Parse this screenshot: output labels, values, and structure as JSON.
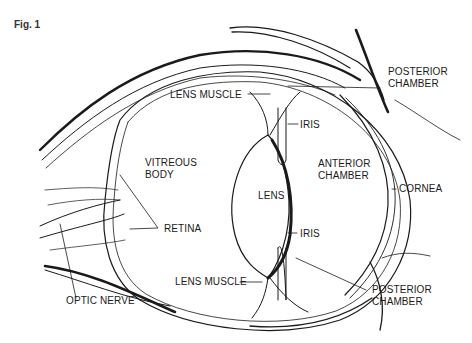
{
  "figure": {
    "caption": "Fig. 1"
  },
  "labels": {
    "posterior_chamber_top": "POSTERIOR\nCHAMBER",
    "lens_muscle_top": "LENS MUSCLE",
    "iris_top": "IRIS",
    "vitreous_body": "VITREOUS\nBODY",
    "lens": "LENS",
    "anterior_chamber": "ANTERIOR\nCHAMBER",
    "cornea": "CORNEA",
    "retina": "RETINA",
    "iris_bottom": "IRIS",
    "lens_muscle_bottom": "LENS MUSCLE",
    "posterior_chamber_bottom": "POSTERIOR\nCHAMBER",
    "optic_nerve": "OPTIC NERVE"
  },
  "colors": {
    "line": "#1a1a1a",
    "background": "#ffffff"
  }
}
